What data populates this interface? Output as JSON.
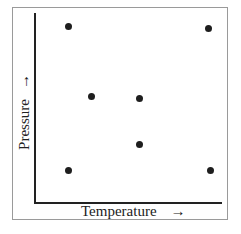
{
  "chart_data": {
    "type": "scatter",
    "title": "",
    "xlabel": "Temperature",
    "ylabel": "Pressure",
    "x_arrow": "→",
    "y_arrow": "→",
    "xlim": [
      0,
      1
    ],
    "ylim": [
      0,
      1
    ],
    "grid": false,
    "ticks": false,
    "legend": null,
    "series": [
      {
        "name": "points",
        "color": "#1e1e1e",
        "points": [
          {
            "x": 0.18,
            "y": 0.93
          },
          {
            "x": 0.93,
            "y": 0.92
          },
          {
            "x": 0.3,
            "y": 0.56
          },
          {
            "x": 0.56,
            "y": 0.55
          },
          {
            "x": 0.56,
            "y": 0.31
          },
          {
            "x": 0.18,
            "y": 0.17
          },
          {
            "x": 0.94,
            "y": 0.17
          }
        ]
      }
    ],
    "note": "Axes have no tick marks or numeric labels; coordinates are normalized estimates of relative position."
  }
}
